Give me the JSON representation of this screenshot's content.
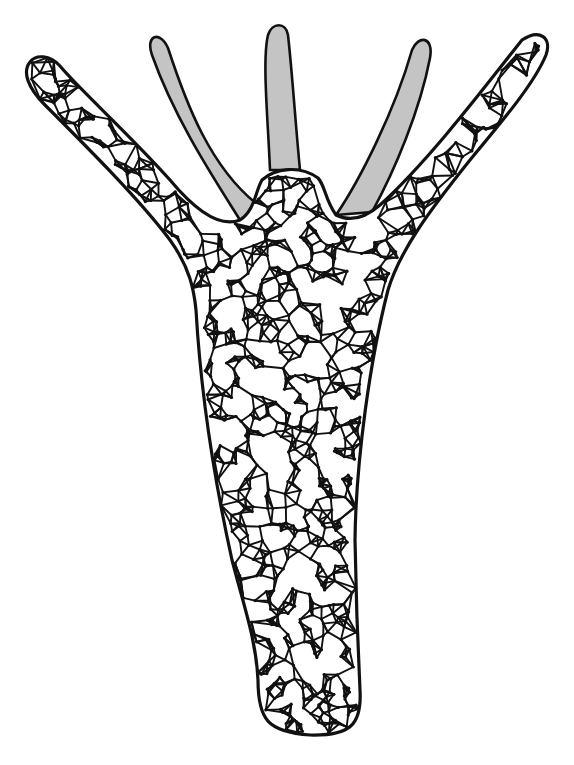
{
  "figure": {
    "colors": {
      "background": "#ffffff",
      "ink": "#111111",
      "tentacle_fill": "#c4c4c4"
    },
    "mesh_seed": 7,
    "mesh_points": 900
  }
}
